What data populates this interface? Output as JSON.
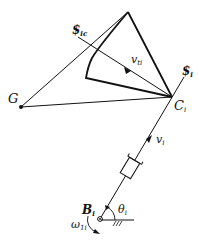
{
  "diagram": {
    "points": {
      "apex": [
        128,
        12
      ],
      "G": [
        21,
        107
      ],
      "C_i": [
        172,
        97
      ],
      "inner_corner": [
        86,
        78
      ],
      "B_i": [
        100,
        219
      ]
    },
    "labels": {
      "screw_ic": {
        "main": "$",
        "sub": "ic"
      },
      "screw_i": {
        "main": "$",
        "sub": "i"
      },
      "v_ti": {
        "main": "v",
        "sub": "ti"
      },
      "G": {
        "main": "G"
      },
      "C_i": {
        "main": "C",
        "sub": "i"
      },
      "v_i": {
        "main": "v",
        "sub": "i"
      },
      "B_i": {
        "main": "B",
        "sub": "i"
      },
      "theta_i": {
        "main": "θ",
        "sub": "i"
      },
      "omega_1i": {
        "main": "ω",
        "sub": "1i"
      }
    },
    "colors": {
      "stroke": "#111111",
      "background": "#ffffff"
    }
  }
}
